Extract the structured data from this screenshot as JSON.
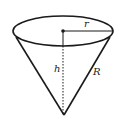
{
  "diagram": {
    "type": "inverted-cone",
    "labels": {
      "radius": "r",
      "height": "h",
      "slant": "R"
    },
    "colors": {
      "stroke": "#1a1a1a",
      "background": "#ffffff"
    }
  }
}
